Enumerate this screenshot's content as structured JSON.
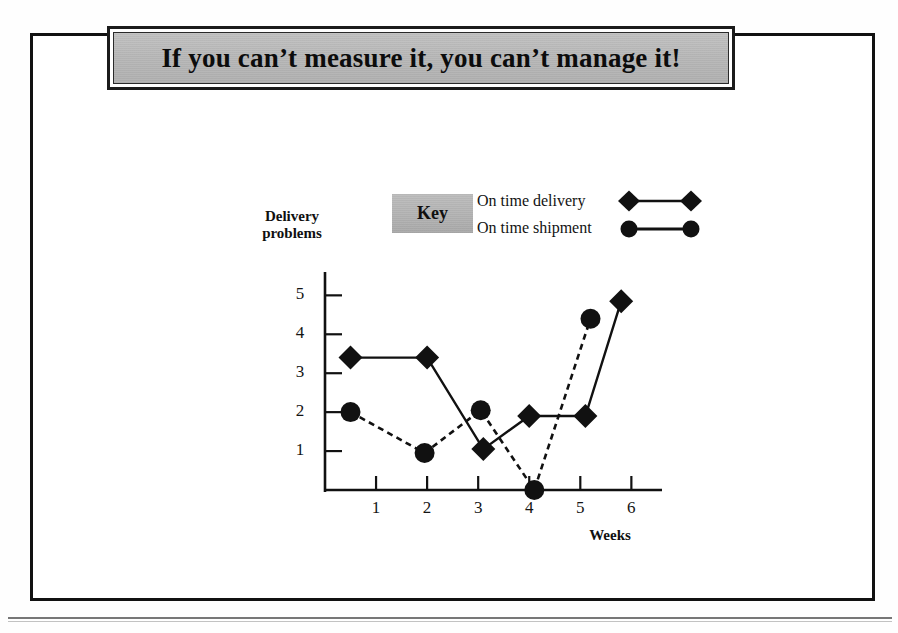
{
  "slide": {
    "title": "If you can’t measure it, you can’t manage it!"
  },
  "legend": {
    "key_label": "Key",
    "entries": [
      {
        "label": "On time delivery",
        "marker": "diamond",
        "line": "solid"
      },
      {
        "label": "On time shipment",
        "marker": "circle",
        "line": "solid"
      }
    ]
  },
  "colors": {
    "ink": "#111111",
    "banner_fill": "#b9b9b9",
    "key_fill": "#b4b4b4",
    "page": "#ffffff"
  },
  "chart_data": {
    "type": "line",
    "title": "",
    "xlabel": "Weeks",
    "ylabel": "Delivery problems",
    "xticks": [
      "1",
      "2",
      "3",
      "4",
      "5",
      "6"
    ],
    "yticks": [
      "1",
      "2",
      "3",
      "4",
      "5"
    ],
    "xlim": [
      0,
      6.6
    ],
    "ylim": [
      0,
      5.6
    ],
    "grid": false,
    "legend_position": "top-center",
    "series": [
      {
        "name": "On time delivery",
        "marker": "diamond",
        "line": "solid",
        "x": [
          0.5,
          2.0,
          3.1,
          4.0,
          5.1,
          5.8
        ],
        "values": [
          3.4,
          3.4,
          1.05,
          1.9,
          1.9,
          4.85
        ]
      },
      {
        "name": "On time shipment",
        "marker": "circle",
        "line": "dashed",
        "x": [
          0.5,
          1.95,
          3.05,
          4.1,
          5.2
        ],
        "values": [
          2.0,
          0.95,
          2.05,
          0.0,
          4.4
        ]
      }
    ]
  }
}
